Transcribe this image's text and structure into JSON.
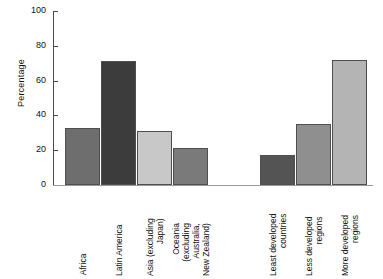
{
  "chart_data": {
    "type": "bar",
    "title": "",
    "xlabel": "",
    "ylabel": "Percentage",
    "ylim": [
      0,
      100
    ],
    "yticks": [
      0,
      20,
      40,
      60,
      80,
      100
    ],
    "grid": false,
    "legend": "none",
    "groups": [
      {
        "name": "regions",
        "categories": [
          "Africa",
          "Latin America",
          "Asia (excluding Japan)",
          "Oceania (excluding Australia, New Zealand)"
        ],
        "values": [
          33,
          71,
          31,
          21
        ]
      },
      {
        "name": "development-groups",
        "categories": [
          "Least developed countries",
          "Less developed regions",
          "More developed regions"
        ],
        "values": [
          17,
          35,
          72
        ]
      }
    ],
    "categories": [
      "Africa",
      "Latin America",
      "Asia (excluding Japan)",
      "Oceania (excluding Australia, New Zealand)",
      "Least developed countries",
      "Less developed regions",
      "More developed regions"
    ],
    "values": [
      33,
      71,
      31,
      21,
      17,
      35,
      72
    ],
    "bar_colors": [
      "#6e6e6e",
      "#3c3c3c",
      "#c8c8c8",
      "#7a7a7a",
      "#545454",
      "#8f8f8f",
      "#b4b4b4"
    ]
  },
  "axes": {
    "y_title": "Percentage",
    "y_ticks": [
      "100",
      "80",
      "60",
      "40",
      "20",
      "0"
    ]
  },
  "bars": [
    {
      "id": "africa",
      "value": 33,
      "color": "#6e6e6e",
      "label_lines": [
        "Africa"
      ]
    },
    {
      "id": "latin-america",
      "value": 71,
      "color": "#3c3c3c",
      "label_lines": [
        "Latin America"
      ]
    },
    {
      "id": "asia-excluding-japan",
      "value": 31,
      "color": "#c8c8c8",
      "label_lines": [
        "Asia (excluding",
        "Japan)"
      ]
    },
    {
      "id": "oceania-excluding-australia-new-zealand",
      "value": 21,
      "color": "#7a7a7a",
      "label_lines": [
        "Oceania",
        "(excluding",
        "Australia,",
        "New Zealand)"
      ]
    },
    {
      "id": "least-developed-countries",
      "value": 17,
      "color": "#545454",
      "label_lines": [
        "Least developed",
        "countries"
      ]
    },
    {
      "id": "less-developed-regions",
      "value": 35,
      "color": "#8f8f8f",
      "label_lines": [
        "Less developed",
        "regions"
      ]
    },
    {
      "id": "more-developed-regions",
      "value": 72,
      "color": "#b4b4b4",
      "label_lines": [
        "More developed",
        "regions"
      ]
    }
  ],
  "layout": {
    "bar_left_px": [
      11,
      47,
      83,
      119,
      206,
      242,
      278
    ],
    "bar_width_px": 35
  }
}
